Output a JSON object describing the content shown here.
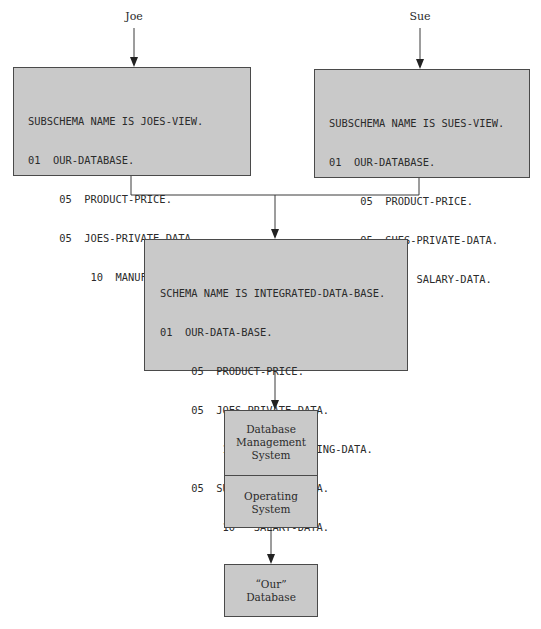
{
  "diagram": {
    "users": [
      {
        "label": "Joe"
      },
      {
        "label": "Sue"
      }
    ],
    "subschemas": [
      {
        "owner": "Joe",
        "lines": [
          "SUBSCHEMA NAME IS JOES-VIEW.",
          "01  OUR-DATABASE.",
          "     05  PRODUCT-PRICE.",
          "     05  JOES-PRIVATE-DATA.",
          "          10  MANUFACTURING-BUDGET."
        ]
      },
      {
        "owner": "Sue",
        "lines": [
          "SUBSCHEMA NAME IS SUES-VIEW.",
          "01  OUR-DATABASE.",
          "     05  PRODUCT-PRICE.",
          "     05  SUES-PRIVATE-DATA.",
          "          10  SALARY-DATA."
        ]
      }
    ],
    "schema": {
      "lines": [
        "SCHEMA NAME IS INTEGRATED-DATA-BASE.",
        "01  OUR-DATA-BASE.",
        "     05  PRODUCT-PRICE.",
        "     05  JOES-PRIVATE-DATA.",
        "          10   MANUFACTURING-DATA.",
        "     05  SUES-PRIVATE-DATA.",
        "          10   SALARY-DATA."
      ]
    },
    "dbms": {
      "top_label": [
        "Database",
        "Management",
        "System"
      ],
      "bottom_label": [
        "Operating",
        "System"
      ]
    },
    "database": {
      "label": [
        "“Our”",
        "Database"
      ]
    },
    "colors": {
      "box_fill": "#c9c9c9",
      "box_border": "#4a4a4a",
      "line": "#3a3a3a",
      "text": "#2b2b2b"
    }
  }
}
